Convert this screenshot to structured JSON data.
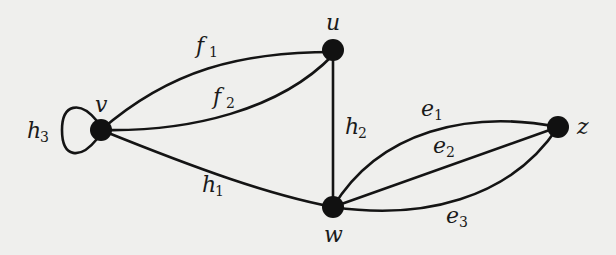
{
  "colors": {
    "background": "#efefed",
    "ink": "#141414"
  },
  "nodes": [
    {
      "id": "v",
      "label": "v"
    },
    {
      "id": "u",
      "label": "u"
    },
    {
      "id": "w",
      "label": "w"
    },
    {
      "id": "z",
      "label": "z"
    }
  ],
  "edges": [
    {
      "id": "f1",
      "name": "f",
      "sub": "1",
      "from": "v",
      "to": "u"
    },
    {
      "id": "f2",
      "name": "f",
      "sub": "2",
      "from": "v",
      "to": "u"
    },
    {
      "id": "h3",
      "name": "h",
      "sub": "3",
      "from": "v",
      "to": "v"
    },
    {
      "id": "h1",
      "name": "h",
      "sub": "1",
      "from": "v",
      "to": "w"
    },
    {
      "id": "h2",
      "name": "h",
      "sub": "2",
      "from": "u",
      "to": "w"
    },
    {
      "id": "e1",
      "name": "e",
      "sub": "1",
      "from": "w",
      "to": "z"
    },
    {
      "id": "e2",
      "name": "e",
      "sub": "2",
      "from": "w",
      "to": "z"
    },
    {
      "id": "e3",
      "name": "e",
      "sub": "3",
      "from": "w",
      "to": "z"
    }
  ]
}
